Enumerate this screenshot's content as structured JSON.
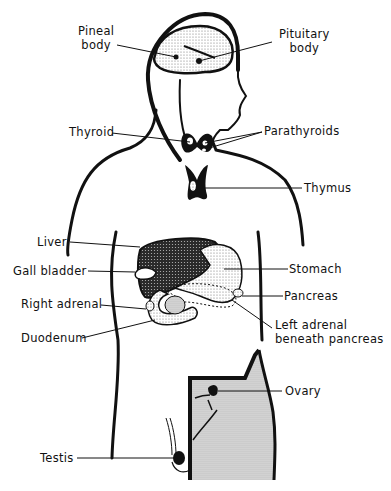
{
  "diagram": {
    "type": "anatomical-illustration",
    "labels": {
      "pineal": [
        "Pineal",
        "body"
      ],
      "pituitary": [
        "Pituitary",
        "body"
      ],
      "thyroid": "Thyroid",
      "parathyroids": "Parathyroids",
      "thymus": "Thymus",
      "liver": "Liver",
      "gall_bladder": "Gall bladder",
      "stomach": "Stomach",
      "right_adrenal": "Right adrenal",
      "pancreas": "Pancreas",
      "duodenum": "Duodenum",
      "left_adrenal": [
        "Left adrenal",
        "beneath pancreas"
      ],
      "ovary": "Ovary",
      "testis": "Testis"
    },
    "colors": {
      "line": "#111111",
      "background": "#ffffff",
      "stipple": "#d8d8d8",
      "dark_organ": "#2a2a2a"
    }
  }
}
